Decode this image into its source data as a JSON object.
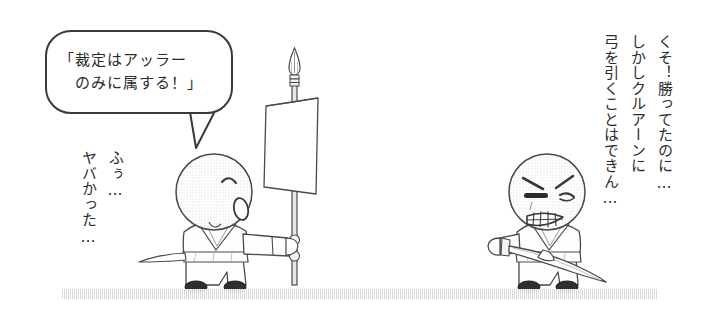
{
  "panel": {
    "width": 711,
    "height": 323,
    "background_color": "#ffffff",
    "ink_color": "#3a3a3a",
    "text_color": "#2b2b2b",
    "ground_color": "#d9d9d9"
  },
  "speech_balloon": {
    "line1": "「裁定はアッラー",
    "line2": "のみに属する！」",
    "full_text": "「裁定はアッラーのみに属する！」"
  },
  "left_character": {
    "name": "calm-swordsman",
    "mutter_columns": [
      "ふぅ…",
      "ヤバかった…"
    ],
    "face": "closed-eye-open-mouth",
    "holds": "banner-spear"
  },
  "right_character": {
    "name": "angry-swordsman",
    "thought_columns": [
      "くそ！勝ってたのに…",
      "しかしクルアーンに",
      "弓を引くことはできん…"
    ],
    "face": "angry-gritted-teeth",
    "holds": "drawn-sword"
  },
  "props": {
    "banner_label": "blank-white-banner",
    "spear_label": "spear-with-leaf-head"
  }
}
